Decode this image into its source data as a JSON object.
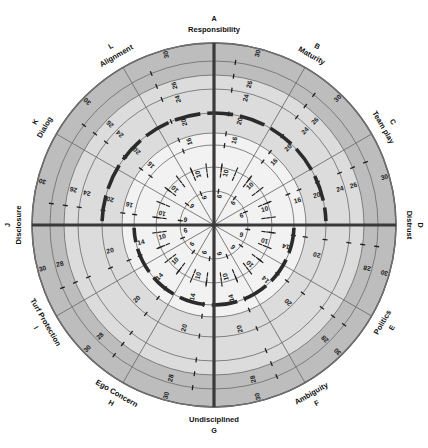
{
  "chart_data": {
    "type": "radar",
    "title": "",
    "center": {
      "x": 214,
      "y": 225
    },
    "outer_radius": 182,
    "sectors": 12,
    "grid": true,
    "legend_position": "none",
    "axis_range": [
      0,
      30
    ],
    "ring_values": [
      6,
      10,
      14,
      16,
      20,
      24,
      26,
      28,
      30
    ],
    "ring_radii": [
      34,
      58,
      80,
      92,
      112,
      136,
      150,
      164,
      182
    ],
    "highlight_ring_top": 20,
    "highlight_ring_bottom": 14,
    "band_colors": {
      "inner": "#f2f2f2",
      "middle": "#dcdcdc",
      "outer": "#bdbdbd",
      "grid_line": "#6f6f6f",
      "axis_line": "#3a3a3a",
      "highlight": "#2b2b2b"
    },
    "categories": [
      {
        "letter": "A",
        "label": "Responsibility",
        "angle_deg": 0
      },
      {
        "letter": "B",
        "label": "Maturity",
        "angle_deg": 30
      },
      {
        "letter": "C",
        "label": "Team play",
        "angle_deg": 60
      },
      {
        "letter": "D",
        "label": "Distrust",
        "angle_deg": 90
      },
      {
        "letter": "E",
        "label": "Politics",
        "angle_deg": 120
      },
      {
        "letter": "F",
        "label": "Ambiguity",
        "angle_deg": 150
      },
      {
        "letter": "G",
        "label": "Undisciplined",
        "angle_deg": 180
      },
      {
        "letter": "H",
        "label": "Ego Concern",
        "angle_deg": 210
      },
      {
        "letter": "I",
        "label": "Turf Protection",
        "angle_deg": 240
      },
      {
        "letter": "J",
        "label": "Disclosure",
        "angle_deg": 270
      },
      {
        "letter": "K",
        "label": "Dialog",
        "angle_deg": 300
      },
      {
        "letter": "L",
        "label": "Alignment",
        "angle_deg": 330
      }
    ],
    "tick_labels_upper": [
      6,
      10,
      16,
      20,
      24,
      26,
      30
    ],
    "tick_labels_lower": [
      6,
      10,
      14,
      20,
      28,
      30
    ]
  }
}
